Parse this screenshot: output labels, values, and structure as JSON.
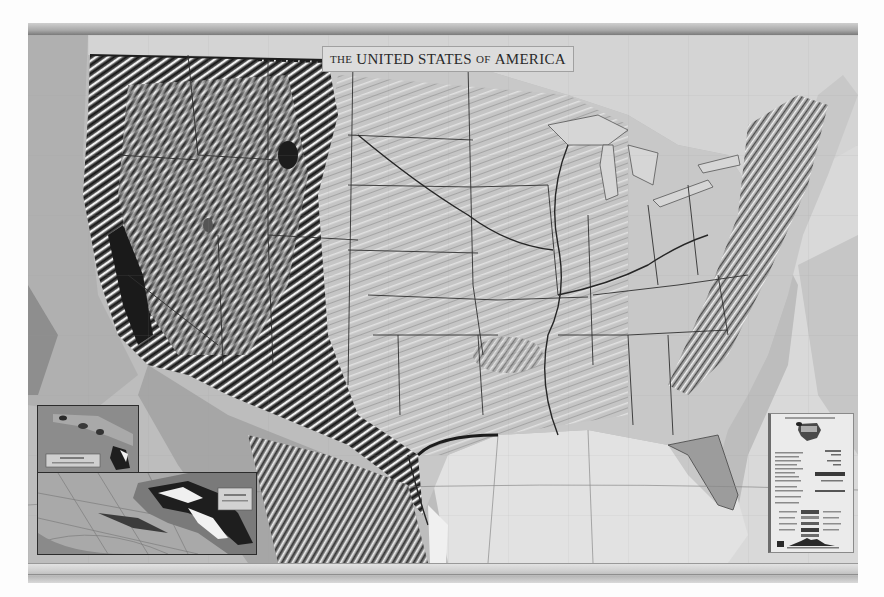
{
  "map": {
    "title_prefix": "The",
    "title_main": "UNITED STATES",
    "title_of": "of",
    "title_suffix": "AMERICA",
    "style": "grayscale shaded relief wall map",
    "region": "Contiguous United States",
    "colors": {
      "ocean": "#bdbdbd",
      "gulf": "#e4e4e4",
      "atlantic": "#d8d8d8",
      "land": "#c9c9c9",
      "relief_dark": "#1e1e1e",
      "relief_light": "#f2f2f2",
      "borders": "#333333"
    }
  },
  "insets": [
    {
      "id": "hawaii",
      "name": "Hawaii inset"
    },
    {
      "id": "alaska",
      "name": "Alaska inset"
    }
  ],
  "legend": {
    "name": "Map legend panel"
  }
}
